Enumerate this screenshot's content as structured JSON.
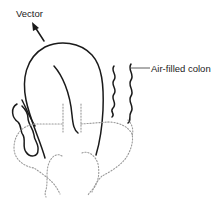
{
  "diagram": {
    "labels": {
      "vector": "Vector",
      "air_filled_colon": "Air-filled colon"
    },
    "elements": [
      "vector-arrow",
      "bladder-outline",
      "air-filled-colon-right",
      "colon-left",
      "dotted-pelvic-outline",
      "dotted-midline-markers"
    ],
    "colors": {
      "outline": "#1a1a1a",
      "dotted": "#9a9a9a",
      "background": "#ffffff"
    }
  }
}
